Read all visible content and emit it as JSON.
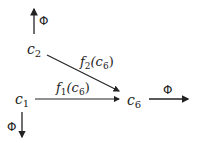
{
  "diagram": {
    "nodes": [
      {
        "id": "c1",
        "label": "c",
        "sub": "1"
      },
      {
        "id": "c2",
        "label": "c",
        "sub": "2"
      },
      {
        "id": "c6",
        "label": "c",
        "sub": "6"
      }
    ],
    "edges": [
      {
        "from": "c1",
        "to": "c6",
        "label_f": "f",
        "label_sub": "1",
        "label_arg": "(c",
        "label_arg_sub": "6",
        "label_close": ")"
      },
      {
        "from": "c2",
        "to": "c6",
        "label_f": "f",
        "label_sub": "2",
        "label_arg": "(c",
        "label_arg_sub": "6",
        "label_close": ")"
      }
    ],
    "outputs": [
      {
        "from": "c2",
        "direction": "up",
        "label": "Φ"
      },
      {
        "from": "c1",
        "direction": "down",
        "label": "Φ"
      },
      {
        "from": "c6",
        "direction": "right",
        "label": "Φ"
      }
    ],
    "colors": {
      "stroke": "#222222",
      "background": "#ffffff"
    }
  }
}
